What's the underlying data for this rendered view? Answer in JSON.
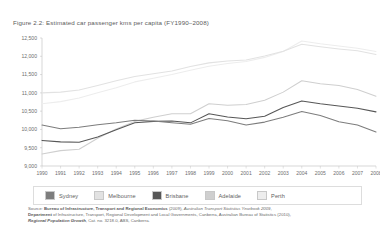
{
  "figure": {
    "title": "Figure 2.2: Estimated car passenger kms per capita (FY1990–2008)"
  },
  "legend": {
    "items": [
      {
        "label": "Sydney",
        "color": "#7d7d7d"
      },
      {
        "label": "Melbourne",
        "color": "#e2e2e2"
      },
      {
        "label": "Brisbane",
        "color": "#575757"
      },
      {
        "label": "Adelaide",
        "color": "#cfcfcf"
      },
      {
        "label": "Perth",
        "color": "#ededed"
      }
    ]
  },
  "source": {
    "line1_prefix": "Source: ",
    "line1_strong": "Bureau of Infrastructure, Transport and Regional Economics",
    "line1_mid": " (2009), ",
    "line1_em": "Australian Transport Statistics Yearbook 2009",
    "line1_suffix": ",",
    "line2_strong": "Department",
    "line2_rest": " of Infrastructure, Transport, Regional Development and Local Governments, Canberra, Australian Bureau of Statistics (2010),",
    "line3_em": "Regional Population Growth",
    "line3_rest": ", Cat. no. 3218.0, ABS, Canberra."
  },
  "chart_data": {
    "type": "line",
    "title": "Estimated car passenger kms per capita (FY1990–2008)",
    "xlabel": "",
    "ylabel": "",
    "ylim": [
      9000,
      12500
    ],
    "ytick_step": 500,
    "yticks": [
      "9,000",
      "9,500",
      "10,000",
      "10,500",
      "11,000",
      "11,500",
      "12,000",
      "12,500"
    ],
    "ytick_values": [
      9000,
      9500,
      10000,
      10500,
      11000,
      11500,
      12000,
      12500
    ],
    "grid": false,
    "legend_position": "bottom",
    "categories": [
      "1990",
      "1991",
      "1992",
      "1993",
      "1994",
      "1995",
      "1996",
      "1997",
      "1998",
      "1999",
      "2000",
      "2001",
      "2002",
      "2003",
      "2004",
      "2005",
      "2006",
      "2007",
      "2008"
    ],
    "x": [
      1990,
      1991,
      1992,
      1993,
      1994,
      1995,
      1996,
      1997,
      1998,
      1999,
      2000,
      2001,
      2002,
      2003,
      2004,
      2005,
      2006,
      2007,
      2008
    ],
    "series": [
      {
        "name": "Sydney",
        "color": "#7d7d7d",
        "values": [
          10120,
          10020,
          10060,
          10130,
          10180,
          10250,
          10230,
          10180,
          10140,
          10300,
          10240,
          10120,
          10200,
          10330,
          10490,
          10380,
          10210,
          10120,
          9930
        ]
      },
      {
        "name": "Melbourne",
        "color": "#e2e2e2",
        "values": [
          11000,
          11020,
          11080,
          11200,
          11330,
          11450,
          11520,
          11600,
          11720,
          11820,
          11870,
          11900,
          12010,
          12140,
          12330,
          12260,
          12200,
          12150,
          12050
        ]
      },
      {
        "name": "Brisbane",
        "color": "#575757",
        "values": [
          9700,
          9660,
          9650,
          9790,
          9990,
          10180,
          10220,
          10230,
          10180,
          10430,
          10340,
          10290,
          10360,
          10600,
          10780,
          10700,
          10640,
          10580,
          10480
        ]
      },
      {
        "name": "Adelaide",
        "color": "#cfcfcf",
        "values": [
          9330,
          9420,
          9460,
          9760,
          10010,
          10220,
          10330,
          10430,
          10430,
          10700,
          10660,
          10680,
          10800,
          11020,
          11330,
          11250,
          11200,
          11090,
          10910
        ]
      },
      {
        "name": "Perth",
        "color": "#ededed",
        "values": [
          10700,
          10760,
          10860,
          11000,
          11140,
          11300,
          11400,
          11500,
          11620,
          11730,
          11800,
          11860,
          11970,
          12130,
          12420,
          12340,
          12280,
          12220,
          12130
        ]
      }
    ]
  }
}
